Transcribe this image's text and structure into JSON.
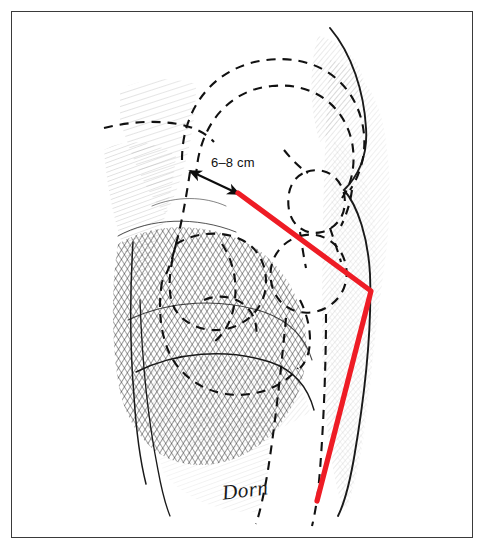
{
  "figure": {
    "domain": "medical-surgical-illustration",
    "frame": {
      "border_color": "#3a3a3a",
      "background": "#ffffff"
    }
  },
  "annotations": {
    "measurement": {
      "text": "6–8 cm",
      "name": "measurement-label",
      "x": 211,
      "y": 162,
      "arrow": {
        "type": "double-headed",
        "from": {
          "x": 190,
          "y": 171
        },
        "to": {
          "x": 239,
          "y": 194
        },
        "color": "#0d0d0d"
      }
    },
    "signature": {
      "text": "Dorn",
      "name": "artist-signature",
      "x": 222,
      "y": 478,
      "color": "#1a1a1a"
    }
  },
  "incision": {
    "name": "incision-line",
    "color": "#ee1c25",
    "width": 5.2,
    "points": [
      {
        "x": 238,
        "y": 193
      },
      {
        "x": 371,
        "y": 291
      },
      {
        "x": 317,
        "y": 501
      }
    ],
    "vertex": {
      "x": 371,
      "y": 291
    }
  },
  "strokes": {
    "skin_outline_color": "#1a1a1a",
    "bone_dash_color": "#111111",
    "bone_dash_pattern": "9 7",
    "shading_color": "#2d2d2d"
  },
  "bone_outlines": [
    {
      "name": "iliac-crest-outer"
    },
    {
      "name": "iliac-crest-inner"
    },
    {
      "name": "ilium-body"
    },
    {
      "name": "acetabulum"
    },
    {
      "name": "greater-trochanter"
    },
    {
      "name": "femoral-neck"
    },
    {
      "name": "femoral-shaft-medial"
    },
    {
      "name": "femoral-shaft-lateral"
    },
    {
      "name": "inguinal-line"
    }
  ]
}
